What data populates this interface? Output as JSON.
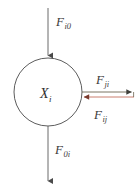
{
  "diagram": {
    "type": "compartment-flow-diagram",
    "background_color": "#ffffff",
    "node": {
      "id": "compartment-xi",
      "shape": "circle",
      "label_base": "X",
      "label_sub": "i",
      "center_x": 48,
      "center_y": 92,
      "radius": 34,
      "stroke_color": "#4a4a4a",
      "fill_color": "#ffffff"
    },
    "arrows": [
      {
        "id": "inflow-from-outside",
        "label_base": "F",
        "label_sub": "i0",
        "direction": "down",
        "from": "outside",
        "to": "compartment-xi",
        "color": "#5a5a5a",
        "x1": 48,
        "y1": 8,
        "x2": 48,
        "y2": 57
      },
      {
        "id": "outflow-to-outside",
        "label_base": "F",
        "label_sub": "0i",
        "direction": "down",
        "from": "compartment-xi",
        "to": "outside",
        "color": "#5a5a5a",
        "x1": 48,
        "y1": 126,
        "x2": 48,
        "y2": 183
      },
      {
        "id": "flow-ji",
        "label_base": "F",
        "label_sub": "ji",
        "direction": "right",
        "from": "compartment-xi",
        "to": "compartment-j",
        "color": "#6b6450",
        "x1": 82,
        "y1": 92,
        "x2": 134,
        "y2": 92
      },
      {
        "id": "flow-ij",
        "label_base": "F",
        "label_sub": "ij",
        "direction": "left",
        "from": "compartment-j",
        "to": "compartment-xi",
        "color": "#c4705e",
        "x1": 134,
        "y1": 97,
        "x2": 81,
        "y2": 97
      }
    ]
  }
}
